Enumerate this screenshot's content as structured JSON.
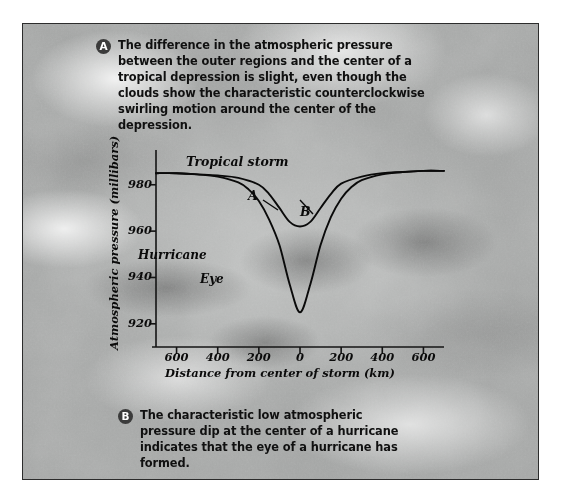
{
  "figure": {
    "background_image": "hurricane-satellite-cloud-photo",
    "frame_color": "#2c2c2c"
  },
  "captions": [
    {
      "badge": "A",
      "text": "The difference in the atmospheric pressure between the outer regions and the center of a tropical depression is slight, even though the clouds show the characteristic counterclockwise swirling motion around the center of the depression."
    },
    {
      "badge": "B",
      "text": "The characteristic low atmospheric pressure dip at the center of a hurricane indicates that the eye of a hurricane has formed."
    }
  ],
  "chart_data": {
    "type": "line",
    "title": "",
    "xlabel": "Distance from center of storm (km)",
    "ylabel": "Atmospheric pressure (millibars)",
    "xlim": [
      -700,
      700
    ],
    "ylim": [
      910,
      995
    ],
    "xticks": [
      {
        "value": -600,
        "label": "600"
      },
      {
        "value": -400,
        "label": "400"
      },
      {
        "value": -200,
        "label": "200"
      },
      {
        "value": 0,
        "label": "0"
      },
      {
        "value": 200,
        "label": "200"
      },
      {
        "value": 400,
        "label": "400"
      },
      {
        "value": 600,
        "label": "600"
      }
    ],
    "yticks": [
      {
        "value": 920,
        "label": "920"
      },
      {
        "value": 940,
        "label": "940"
      },
      {
        "value": 960,
        "label": "960"
      },
      {
        "value": 980,
        "label": "980"
      }
    ],
    "grid": false,
    "legend": "none",
    "series": [
      {
        "name": "Tropical storm",
        "marker_label": "A",
        "x": [
          -700,
          -600,
          -500,
          -400,
          -300,
          -200,
          -150,
          -100,
          -50,
          0,
          50,
          100,
          150,
          200,
          300,
          400,
          500,
          600,
          700
        ],
        "y": [
          985,
          985,
          984.5,
          984,
          983,
          980,
          976,
          970,
          964,
          962,
          964,
          970,
          976,
          980.5,
          983.5,
          985,
          985.5,
          986,
          986
        ]
      },
      {
        "name": "Hurricane",
        "marker_label": "B",
        "x": [
          -700,
          -600,
          -500,
          -400,
          -300,
          -250,
          -200,
          -150,
          -100,
          -50,
          0,
          50,
          100,
          150,
          200,
          250,
          300,
          400,
          500,
          600,
          700
        ],
        "y": [
          985,
          985,
          984.5,
          983.5,
          981,
          978,
          973,
          965,
          954,
          937,
          925,
          937,
          954,
          966,
          974,
          979,
          982,
          984.5,
          985.5,
          986,
          986
        ]
      }
    ],
    "annotations": [
      {
        "label": "Tropical storm",
        "note": "curve-name-label"
      },
      {
        "label": "Hurricane",
        "note": "curve-name-label"
      },
      {
        "label": "Eye",
        "note": "eye-of-hurricane-label"
      },
      {
        "label": "A",
        "note": "leader-to-tropical-storm-curve"
      },
      {
        "label": "B",
        "note": "leader-to-hurricane-curve"
      }
    ]
  }
}
